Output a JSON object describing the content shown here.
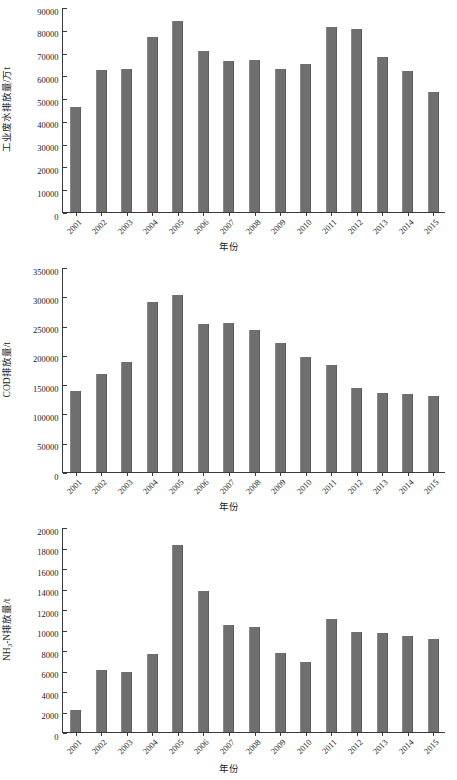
{
  "figure": {
    "xaxis_title": "年份",
    "bar_color": "#6f6f6f",
    "axis_color": "#3a3a3a",
    "background": "#ffffff"
  },
  "chart_data": [
    {
      "type": "bar",
      "title": "",
      "ylabel": "工业废水排放量/万t",
      "xlabel": "年份",
      "categories": [
        "2001",
        "2002",
        "2003",
        "2004",
        "2005",
        "2006",
        "2007",
        "2008",
        "2009",
        "2010",
        "2011",
        "2012",
        "2013",
        "2014",
        "2015"
      ],
      "values": [
        46200,
        62400,
        62700,
        76900,
        84000,
        70700,
        66200,
        66800,
        63000,
        65200,
        81100,
        80500,
        68200,
        62100,
        52900
      ],
      "ylim": [
        0,
        90000
      ],
      "yticks": [
        0,
        10000,
        20000,
        30000,
        40000,
        50000,
        60000,
        70000,
        80000,
        90000
      ],
      "ytick_labels": [
        "0",
        "10000",
        "20000",
        "30000",
        "40000",
        "50000",
        "60000",
        "70000",
        "80000",
        "90000"
      ],
      "grid": false,
      "legend": "none"
    },
    {
      "type": "bar",
      "title": "",
      "ylabel": "COD排放量/t",
      "xlabel": "年份",
      "categories": [
        "2001",
        "2002",
        "2003",
        "2004",
        "2005",
        "2006",
        "2007",
        "2008",
        "2009",
        "2010",
        "2011",
        "2012",
        "2013",
        "2014",
        "2015"
      ],
      "values": [
        138000,
        168000,
        188000,
        291000,
        302000,
        253000,
        254000,
        243000,
        221000,
        197000,
        183000,
        143000,
        135000,
        133000,
        129000
      ],
      "ylim": [
        0,
        350000
      ],
      "yticks": [
        0,
        50000,
        100000,
        150000,
        200000,
        250000,
        300000,
        350000
      ],
      "ytick_labels": [
        "0",
        "50000",
        "100000",
        "150000",
        "200000",
        "250000",
        "300000",
        "350000"
      ],
      "grid": false,
      "legend": "none"
    },
    {
      "type": "bar",
      "title": "",
      "ylabel_html": "NH<sub>3</sub>-N排放量/t",
      "ylabel": "NH3-N排放量/t",
      "xlabel": "年份",
      "categories": [
        "2001",
        "2002",
        "2003",
        "2004",
        "2005",
        "2006",
        "2007",
        "2008",
        "2009",
        "2010",
        "2011",
        "2012",
        "2013",
        "2014",
        "2015"
      ],
      "values": [
        2100,
        6050,
        5900,
        7650,
        18250,
        13750,
        10400,
        10250,
        7700,
        6800,
        11000,
        9800,
        9700,
        9400,
        9100
      ],
      "ylim": [
        0,
        20000
      ],
      "yticks": [
        0,
        2000,
        4000,
        6000,
        8000,
        10000,
        12000,
        14000,
        16000,
        18000,
        20000
      ],
      "ytick_labels": [
        "0",
        "2000",
        "4000",
        "6000",
        "8000",
        "10000",
        "12000",
        "14000",
        "16000",
        "18000",
        "20000"
      ],
      "grid": false,
      "legend": "none"
    }
  ]
}
